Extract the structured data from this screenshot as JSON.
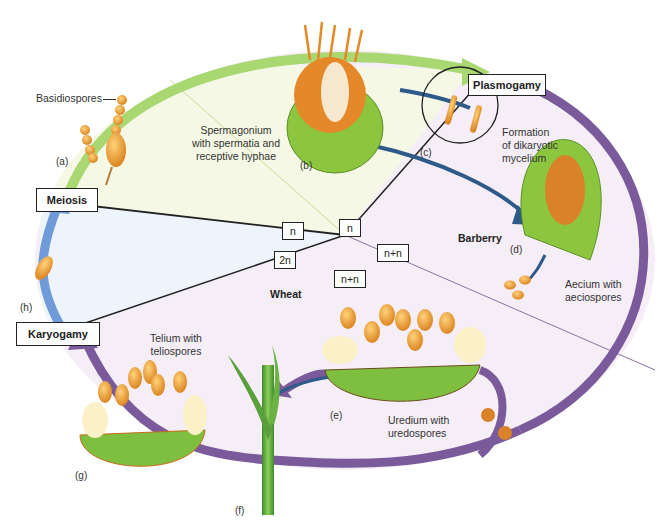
{
  "colors": {
    "haploid_region": "#f4f8e4",
    "diploid_region": "#eef4fb",
    "dikaryon_region": "#f6eef7",
    "green_arrow": "#a9d873",
    "blue_arrow": "#6f9bd8",
    "purple_arrow": "#7a5a9a",
    "dark_blue_arrow": "#2e5a8a",
    "spore_orange": "#e89a2e",
    "tissue_green": "#8cc63f",
    "line": "#222222"
  },
  "phases": {
    "plasmogamy": "Plasmogamy",
    "meiosis": "Meiosis",
    "karyogamy": "Karyogamy"
  },
  "ploidy": {
    "n_left": "n",
    "n_top": "n",
    "diploid": "2n",
    "dikaryon_right": "n+n",
    "dikaryon_bottom": "n+n"
  },
  "hosts": {
    "barberry": "Barberry",
    "wheat": "Wheat"
  },
  "structures": {
    "basidiospores": "Basidiospores",
    "spermagonium_l1": "Spermagonium",
    "spermagonium_l2": "with spermatia and",
    "spermagonium_l3": "receptive hyphae",
    "dikaryotic_l1": "Formation",
    "dikaryotic_l2": "of dikaryotic",
    "dikaryotic_l3": "mycelium",
    "aecium_l1": "Aecium with",
    "aecium_l2": "aeciospores",
    "telium_l1": "Telium with",
    "telium_l2": "teliospores",
    "uredium_l1": "Uredium with",
    "uredium_l2": "uredospores"
  },
  "stage_letters": {
    "a": "(a)",
    "b": "(b)",
    "c": "(c)",
    "d": "(d)",
    "e": "(e)",
    "f": "(f)",
    "g": "(g)",
    "h": "(h)"
  }
}
